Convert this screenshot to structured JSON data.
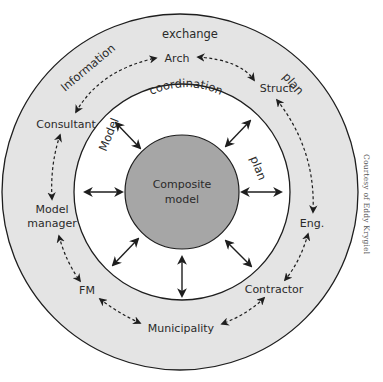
{
  "diagram": {
    "colors": {
      "outer_ring": "#e4e4e4",
      "middle_ring": "#ffffff",
      "core": "#a6a6a6",
      "stroke": "#1e1e1e",
      "text": "#2a2a2a"
    },
    "core": {
      "line1": "Composite",
      "line2": "model"
    },
    "middle_ring_labels": {
      "top": "coordination",
      "left": "Model",
      "right": "plan"
    },
    "outer_ring_labels": {
      "top": "exchange",
      "top_left": "Information",
      "top_right": "plan"
    },
    "stakeholders": {
      "arch": "Arch",
      "struct": "Struct.",
      "consultant": "Consultant",
      "model_manager_line1": "Model",
      "model_manager_line2": "manager",
      "eng": "Eng.",
      "fm": "FM",
      "contractor": "Contractor",
      "municipality": "Municipality"
    },
    "credit": "Courtesy of Eddy Krygiel"
  }
}
